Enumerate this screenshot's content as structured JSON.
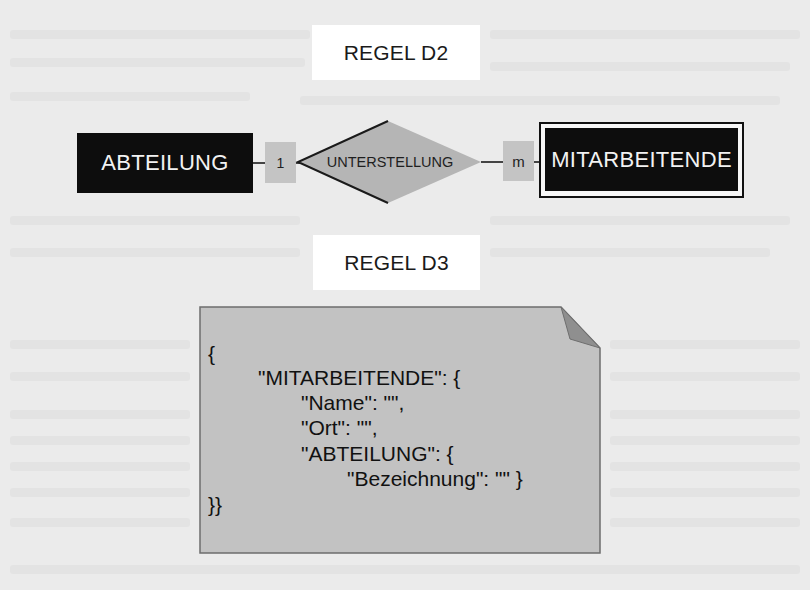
{
  "rules": {
    "d2_title": "REGEL D2",
    "d3_title": "REGEL D3"
  },
  "er_diagram": {
    "entity_left": "ABTEILUNG",
    "cardinality_left": "1",
    "relationship": "UNTERSTELLUNG",
    "cardinality_right": "m",
    "entity_right": "MITARBEITENDE"
  },
  "json_document": {
    "lines": [
      "{",
      "\"MITARBEITENDE\": {",
      "\"Name\": \"\",",
      "\"Ort\": \"\",",
      "\"ABTEILUNG\": {",
      "\"Bezeichnung\": \"\" }",
      "}}"
    ]
  },
  "colors": {
    "background": "#ebebeb",
    "entity_fill": "#0d0d0d",
    "relationship_fill": "#b5b5b5",
    "cardinality_fill": "#c4c4c4",
    "document_fill": "#c2c2c2",
    "document_fold": "#8f8f8f"
  }
}
